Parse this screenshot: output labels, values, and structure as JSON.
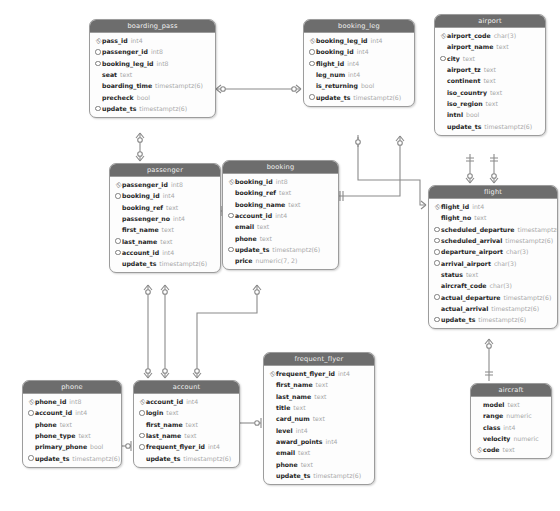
{
  "diagram": {
    "notation": "crow's foot",
    "colors": {
      "header_bg": "#6d6d6d",
      "header_text": "#f2f2f2",
      "body_bg": "#fdfdfd",
      "border": "#9c9c9c",
      "connector": "#8a8a8a",
      "type_text": "#a8a8a8"
    },
    "icons": {
      "primary_key": "key-icon",
      "foreign_key": "circle-icon"
    }
  },
  "tables": [
    {
      "id": "boarding_pass",
      "name": "boarding_pass",
      "x": 89,
      "y": 19,
      "w": 125,
      "columns": [
        {
          "marker": "key",
          "name": "pass_id",
          "type": "int4"
        },
        {
          "marker": "dot",
          "name": "passenger_id",
          "type": "int8"
        },
        {
          "marker": "dot",
          "name": "booking_leg_id",
          "type": "int8"
        },
        {
          "marker": "none",
          "name": "seat",
          "type": "text"
        },
        {
          "marker": "none",
          "name": "boarding_time",
          "type": "timestamptz(6)"
        },
        {
          "marker": "none",
          "name": "precheck",
          "type": "bool"
        },
        {
          "marker": "dot",
          "name": "update_ts",
          "type": "timestamptz(6)"
        }
      ]
    },
    {
      "id": "booking_leg",
      "name": "booking_leg",
      "x": 303,
      "y": 19,
      "w": 110,
      "columns": [
        {
          "marker": "key",
          "name": "booking_leg_id",
          "type": "int4"
        },
        {
          "marker": "dot",
          "name": "booking_id",
          "type": "int4"
        },
        {
          "marker": "dot",
          "name": "flight_id",
          "type": "int4"
        },
        {
          "marker": "none",
          "name": "leg_num",
          "type": "int4"
        },
        {
          "marker": "none",
          "name": "is_returning",
          "type": "bool"
        },
        {
          "marker": "dot",
          "name": "update_ts",
          "type": "timestamptz(6)"
        }
      ]
    },
    {
      "id": "airport",
      "name": "airport",
      "x": 434,
      "y": 14,
      "w": 110,
      "columns": [
        {
          "marker": "key",
          "name": "airport_code",
          "type": "char(3)"
        },
        {
          "marker": "none",
          "name": "airport_name",
          "type": "text"
        },
        {
          "marker": "dot",
          "name": "city",
          "type": "text"
        },
        {
          "marker": "none",
          "name": "airport_tz",
          "type": "text"
        },
        {
          "marker": "none",
          "name": "continent",
          "type": "text"
        },
        {
          "marker": "none",
          "name": "iso_country",
          "type": "text"
        },
        {
          "marker": "none",
          "name": "iso_region",
          "type": "text"
        },
        {
          "marker": "none",
          "name": "intnl",
          "type": "bool"
        },
        {
          "marker": "none",
          "name": "update_ts",
          "type": "timestamptz(6)"
        }
      ]
    },
    {
      "id": "passenger",
      "name": "passenger",
      "x": 109,
      "y": 163,
      "w": 110,
      "columns": [
        {
          "marker": "key",
          "name": "passenger_id",
          "type": "int8"
        },
        {
          "marker": "dot",
          "name": "booking_id",
          "type": "int4"
        },
        {
          "marker": "none",
          "name": "booking_ref",
          "type": "text"
        },
        {
          "marker": "none",
          "name": "passenger_no",
          "type": "int4"
        },
        {
          "marker": "none",
          "name": "first_name",
          "type": "text"
        },
        {
          "marker": "dot",
          "name": "last_name",
          "type": "text"
        },
        {
          "marker": "dot",
          "name": "account_id",
          "type": "int4"
        },
        {
          "marker": "none",
          "name": "update_ts",
          "type": "timestamptz(6)"
        }
      ]
    },
    {
      "id": "booking",
      "name": "booking",
      "x": 222,
      "y": 160,
      "w": 115,
      "columns": [
        {
          "marker": "key",
          "name": "booking_id",
          "type": "int8"
        },
        {
          "marker": "none",
          "name": "booking_ref",
          "type": "text"
        },
        {
          "marker": "none",
          "name": "booking_name",
          "type": "text"
        },
        {
          "marker": "dot",
          "name": "account_id",
          "type": "int4"
        },
        {
          "marker": "none",
          "name": "email",
          "type": "text"
        },
        {
          "marker": "none",
          "name": "phone",
          "type": "text"
        },
        {
          "marker": "dot",
          "name": "update_ts",
          "type": "timestamptz(6)"
        },
        {
          "marker": "none",
          "name": "price",
          "type": "numeric(7, 2)"
        }
      ]
    },
    {
      "id": "flight",
      "name": "flight",
      "x": 428,
      "y": 185,
      "w": 128,
      "columns": [
        {
          "marker": "key",
          "name": "flight_id",
          "type": "int4"
        },
        {
          "marker": "none",
          "name": "flight_no",
          "type": "text"
        },
        {
          "marker": "dot",
          "name": "scheduled_departure",
          "type": "timestamptz(6)"
        },
        {
          "marker": "dot",
          "name": "scheduled_arrival",
          "type": "timestamptz(6)"
        },
        {
          "marker": "dot",
          "name": "departure_airport",
          "type": "char(3)"
        },
        {
          "marker": "dot",
          "name": "arrival_airport",
          "type": "char(3)"
        },
        {
          "marker": "none",
          "name": "status",
          "type": "text"
        },
        {
          "marker": "none",
          "name": "aircraft_code",
          "type": "char(3)"
        },
        {
          "marker": "dot",
          "name": "actual_departure",
          "type": "timestamptz(6)"
        },
        {
          "marker": "none",
          "name": "actual_arrival",
          "type": "timestamptz(6)"
        },
        {
          "marker": "dot",
          "name": "update_ts",
          "type": "timestamptz(6)"
        }
      ]
    },
    {
      "id": "frequent_flyer",
      "name": "frequent_flyer",
      "x": 263,
      "y": 352,
      "w": 110,
      "columns": [
        {
          "marker": "key",
          "name": "frequent_flyer_id",
          "type": "int4"
        },
        {
          "marker": "none",
          "name": "first_name",
          "type": "text"
        },
        {
          "marker": "none",
          "name": "last_name",
          "type": "text"
        },
        {
          "marker": "none",
          "name": "title",
          "type": "text"
        },
        {
          "marker": "none",
          "name": "card_num",
          "type": "text"
        },
        {
          "marker": "none",
          "name": "level",
          "type": "int4"
        },
        {
          "marker": "none",
          "name": "award_points",
          "type": "int4"
        },
        {
          "marker": "none",
          "name": "email",
          "type": "text"
        },
        {
          "marker": "none",
          "name": "phone",
          "type": "text"
        },
        {
          "marker": "none",
          "name": "update_ts",
          "type": "timestamptz(6)"
        }
      ]
    },
    {
      "id": "account",
      "name": "account",
      "x": 133,
      "y": 380,
      "w": 105,
      "columns": [
        {
          "marker": "key",
          "name": "account_id",
          "type": "int4"
        },
        {
          "marker": "dot",
          "name": "login",
          "type": "text"
        },
        {
          "marker": "none",
          "name": "first_name",
          "type": "text"
        },
        {
          "marker": "dot",
          "name": "last_name",
          "type": "text"
        },
        {
          "marker": "dot",
          "name": "frequent_flyer_id",
          "type": "int4"
        },
        {
          "marker": "none",
          "name": "update_ts",
          "type": "timestamptz(6)"
        }
      ]
    },
    {
      "id": "phone",
      "name": "phone",
      "x": 22,
      "y": 380,
      "w": 98,
      "columns": [
        {
          "marker": "key",
          "name": "phone_id",
          "type": "int8"
        },
        {
          "marker": "dot",
          "name": "account_id",
          "type": "int4"
        },
        {
          "marker": "none",
          "name": "phone",
          "type": "text"
        },
        {
          "marker": "none",
          "name": "phone_type",
          "type": "text"
        },
        {
          "marker": "none",
          "name": "primary_phone",
          "type": "bool"
        },
        {
          "marker": "dot",
          "name": "update_ts",
          "type": "timestamptz(6)"
        }
      ]
    },
    {
      "id": "aircraft",
      "name": "aircraft",
      "x": 470,
      "y": 383,
      "w": 80,
      "columns": [
        {
          "marker": "none",
          "name": "model",
          "type": "text"
        },
        {
          "marker": "none",
          "name": "range",
          "type": "numeric"
        },
        {
          "marker": "none",
          "name": "class",
          "type": "int4"
        },
        {
          "marker": "none",
          "name": "velocity",
          "type": "numeric"
        },
        {
          "marker": "key",
          "name": "code",
          "type": "text"
        }
      ]
    }
  ],
  "relationships": [
    {
      "from": "boarding_pass",
      "to": "booking_leg",
      "label": "boarding_pass.booking_leg_id -> booking_leg.booking_leg_id"
    },
    {
      "from": "boarding_pass",
      "to": "passenger",
      "label": "boarding_pass.passenger_id -> passenger.passenger_id"
    },
    {
      "from": "passenger",
      "to": "booking",
      "label": "passenger.booking_id -> booking.booking_id"
    },
    {
      "from": "booking",
      "to": "booking_leg",
      "label": "booking_leg.booking_id -> booking.booking_id"
    },
    {
      "from": "booking_leg",
      "to": "flight",
      "label": "booking_leg.flight_id -> flight.flight_id"
    },
    {
      "from": "airport",
      "to": "flight",
      "label": "flight.departure_airport -> airport.airport_code"
    },
    {
      "from": "airport",
      "to": "flight",
      "label": "flight.arrival_airport -> airport.airport_code"
    },
    {
      "from": "flight",
      "to": "aircraft",
      "label": "flight.aircraft_code -> aircraft.code"
    },
    {
      "from": "passenger",
      "to": "account",
      "label": "passenger.account_id -> account.account_id"
    },
    {
      "from": "booking",
      "to": "account",
      "label": "booking.account_id -> account.account_id"
    },
    {
      "from": "phone",
      "to": "account",
      "label": "phone.account_id -> account.account_id"
    },
    {
      "from": "account",
      "to": "frequent_flyer",
      "label": "account.frequent_flyer_id -> frequent_flyer.frequent_flyer_id"
    }
  ]
}
